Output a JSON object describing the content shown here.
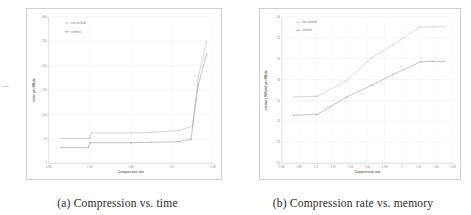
{
  "figure": {
    "panels": [
      {
        "id": "panel-a",
        "caption": "(a) Compression vs. time",
        "chart_data": {
          "type": "line",
          "title": "",
          "xlabel": "Compression rate",
          "ylabel": "msec per MByte",
          "xlim": [
            1.86,
            2.06
          ],
          "ylim": [
            0,
            300
          ],
          "xticks": [
            "1.86",
            "1.91",
            "1.96",
            "2.01",
            "2.06"
          ],
          "xtick_values": [
            1.86,
            1.91,
            1.96,
            2.01,
            2.06
          ],
          "yticks": [
            "0",
            "50",
            "100",
            "150",
            "200",
            "250",
            "300"
          ],
          "ytick_values": [
            0,
            50,
            100,
            150,
            200,
            250,
            300
          ],
          "grid": true,
          "legend_position": "top-left",
          "series": [
            {
              "name": "not-verified",
              "color": "#9a9a9a",
              "x": [
                1.875,
                1.91,
                1.912,
                1.96,
                1.985,
                2.018,
                2.035,
                2.042,
                2.052
              ],
              "y": [
                51,
                51,
                62,
                62,
                63,
                67,
                76,
                178,
                249
              ]
            },
            {
              "name": "verified",
              "color": "#6f6f6f",
              "x": [
                1.875,
                1.908,
                1.91,
                1.96,
                1.985,
                2.018,
                2.033,
                2.042,
                2.052
              ],
              "y": [
                32,
                32,
                42,
                42,
                43,
                44,
                49,
                160,
                224
              ]
            }
          ]
        }
      },
      {
        "id": "panel-b",
        "caption": "(b) Compression rate vs. memory",
        "chart_data": {
          "type": "line",
          "title": "",
          "xlabel": "Compression rate",
          "ylabel": "memory (MByte) per MByte",
          "xlim": [
            1.86,
            2.06
          ],
          "ylim": [
            20,
            34
          ],
          "xticks": [
            "1.86",
            "1.88",
            "1.9",
            "1.92",
            "1.94",
            "1.96",
            "1.98",
            "2",
            "2.02",
            "2.04",
            "2.06"
          ],
          "xtick_values": [
            1.86,
            1.88,
            1.9,
            1.92,
            1.94,
            1.96,
            1.98,
            2.0,
            2.02,
            2.04,
            2.06
          ],
          "yticks": [
            "20",
            "22",
            "24",
            "26",
            "28",
            "30",
            "32",
            "34"
          ],
          "ytick_values": [
            20,
            22,
            24,
            26,
            28,
            30,
            32,
            34
          ],
          "grid": true,
          "legend_position": "top-left",
          "series": [
            {
              "name": "not-verified",
              "color": "#a8a8a8",
              "x": [
                1.874,
                1.901,
                1.935,
                1.965,
                1.99,
                2.022,
                2.036,
                2.05
              ],
              "y": [
                26.35,
                26.4,
                27.85,
                30.1,
                31.35,
                33.05,
                33.05,
                33.05
              ]
            },
            {
              "name": "verified",
              "color": "#6f6f6f",
              "x": [
                1.874,
                1.901,
                1.935,
                1.965,
                1.99,
                2.022,
                2.036,
                2.05
              ],
              "y": [
                24.6,
                24.65,
                26.3,
                27.45,
                28.5,
                29.7,
                29.75,
                29.75
              ]
            }
          ]
        }
      }
    ]
  }
}
